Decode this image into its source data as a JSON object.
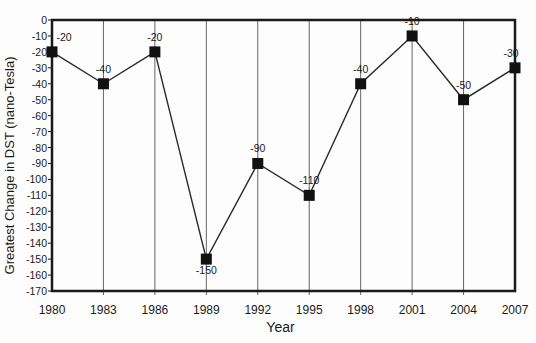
{
  "chart_data": {
    "type": "line",
    "title": "",
    "xlabel": "Year",
    "ylabel": "Greatest Change in DST (nano-Tesla)",
    "categories": [
      "1980",
      "1983",
      "1986",
      "1989",
      "1992",
      "1995",
      "1998",
      "2001",
      "2004",
      "2007"
    ],
    "series": [
      {
        "name": "Greatest Change in DST",
        "values": [
          -20,
          -40,
          -20,
          -150,
          -90,
          -110,
          -40,
          -10,
          -50,
          -30
        ]
      }
    ],
    "data_labels": [
      "-20",
      "-40",
      "-20",
      "-150",
      "-90",
      "-110",
      "-40",
      "-10",
      "-50",
      "-30"
    ],
    "ylim": [
      -170,
      0
    ],
    "yticks": [
      0,
      -10,
      -20,
      -30,
      -40,
      -50,
      -60,
      -70,
      -80,
      -90,
      -100,
      -110,
      -120,
      -130,
      -140,
      -150,
      -160,
      -170
    ],
    "grid": "vertical lines at each category",
    "legend": "none",
    "marker": "square",
    "colors": {
      "line": "#2a2a2a",
      "marker": "#111111",
      "axis": "#1a1a1a",
      "grid": "#555555"
    }
  }
}
